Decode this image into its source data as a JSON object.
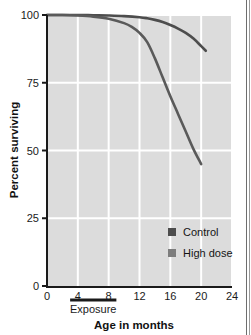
{
  "chart_data": {
    "type": "line",
    "title": "",
    "xlabel": "Age in months",
    "ylabel": "Percent surviving",
    "xlim": [
      0,
      24
    ],
    "ylim": [
      0,
      100
    ],
    "xticks": [
      "0",
      "4",
      "8",
      "12",
      "16",
      "20",
      "24"
    ],
    "xtick_values": [
      0,
      4,
      8,
      12,
      16,
      20,
      24
    ],
    "yticks": [
      "0",
      "25",
      "50",
      "75",
      "100"
    ],
    "ytick_values": [
      0,
      25,
      50,
      75,
      100
    ],
    "grid": true,
    "grid_color": "#ffffff",
    "plot_background": "#dcdcdc",
    "legend_position": "inside-lower-right",
    "series": [
      {
        "name": "Control",
        "color": "#4d4d4d",
        "x": [
          0,
          2,
          4,
          6,
          8,
          10,
          12,
          13,
          14,
          15,
          16,
          17,
          18,
          19,
          20,
          20.6
        ],
        "values": [
          100,
          100,
          100,
          99.9,
          99.8,
          99.6,
          99.2,
          98.8,
          98.2,
          97.4,
          96.3,
          95.0,
          93.4,
          91.3,
          88.5,
          86.8
        ]
      },
      {
        "name": "High dose",
        "color": "#5a5a5a",
        "x": [
          0,
          2,
          4,
          6,
          8,
          10,
          11,
          12,
          13,
          14,
          15,
          16,
          17,
          18,
          19,
          20
        ],
        "values": [
          100,
          100,
          99.8,
          99.4,
          98.6,
          97.0,
          95.6,
          93.4,
          90.0,
          84.0,
          77.0,
          70.0,
          63.5,
          57.0,
          50.5,
          45.0
        ]
      }
    ],
    "annotations": [
      {
        "name": "exposure-bar",
        "label": "Exposure",
        "x_start": 3,
        "x_end": 9
      }
    ]
  },
  "legend": {
    "items": [
      {
        "label": "Control",
        "swatch_color": "#4d4d4d"
      },
      {
        "label": "High dose",
        "swatch_color": "#7d7d7d"
      }
    ]
  },
  "axes": {
    "y_title": "Percent surviving",
    "x_title": "Age in months",
    "y_labels": [
      "100",
      "75",
      "50",
      "25",
      "0"
    ],
    "x_labels": [
      "0",
      "4",
      "8",
      "12",
      "16",
      "20",
      "24"
    ]
  },
  "exposure": {
    "label": "Exposure"
  },
  "colors": {
    "plot_bg": "#dcdcdc",
    "grid": "#ffffff",
    "axis": "#1a1a1a",
    "control_line": "#4d4d4d",
    "highdose_line": "#5a5a5a",
    "text": "#111111"
  }
}
